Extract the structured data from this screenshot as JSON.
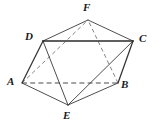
{
  "figure": {
    "kind": "geometric-solid-diagram",
    "canvas": {
      "width": 159,
      "height": 126,
      "background": "#ffffff"
    },
    "colors": {
      "stroke_solid": "#3a3a3a",
      "stroke_solid_bold": "#2b2b2b",
      "stroke_hidden": "#4a4a4a",
      "label": "#1a1a1a"
    },
    "vertices": [
      {
        "id": "F",
        "label": "F",
        "x": 88,
        "y": 20,
        "label_x": 83,
        "label_y": 2
      },
      {
        "id": "D",
        "label": "D",
        "x": 43,
        "y": 41,
        "label_x": 25,
        "label_y": 31
      },
      {
        "id": "C",
        "label": "C",
        "x": 133,
        "y": 41,
        "label_x": 139,
        "label_y": 33
      },
      {
        "id": "A",
        "label": "A",
        "x": 22,
        "y": 83,
        "label_x": 7,
        "label_y": 76
      },
      {
        "id": "B",
        "label": "B",
        "x": 118,
        "y": 83,
        "label_x": 121,
        "label_y": 79
      },
      {
        "id": "E",
        "label": "E",
        "x": 68,
        "y": 105,
        "label_x": 63,
        "label_y": 110
      }
    ],
    "edges": [
      {
        "from": "D",
        "to": "C",
        "style": "solid-bold",
        "hidden": false
      },
      {
        "from": "A",
        "to": "D",
        "style": "solid-mid",
        "hidden": false
      },
      {
        "from": "B",
        "to": "C",
        "style": "solid-mid",
        "hidden": false
      },
      {
        "from": "A",
        "to": "E",
        "style": "solid",
        "hidden": false
      },
      {
        "from": "B",
        "to": "E",
        "style": "solid",
        "hidden": false
      },
      {
        "from": "D",
        "to": "F",
        "style": "solid",
        "hidden": false
      },
      {
        "from": "C",
        "to": "F",
        "style": "solid",
        "hidden": false
      },
      {
        "from": "D",
        "to": "E",
        "style": "solid",
        "hidden": false
      },
      {
        "from": "C",
        "to": "E",
        "style": "solid",
        "hidden": false
      },
      {
        "from": "A",
        "to": "B",
        "style": "dashed",
        "hidden": true
      },
      {
        "from": "A",
        "to": "F",
        "style": "dashed-fine",
        "hidden": true
      },
      {
        "from": "B",
        "to": "F",
        "style": "dashed-fine",
        "hidden": true
      }
    ],
    "labels": {
      "A": "A",
      "B": "B",
      "C": "C",
      "D": "D",
      "E": "E",
      "F": "F"
    }
  }
}
